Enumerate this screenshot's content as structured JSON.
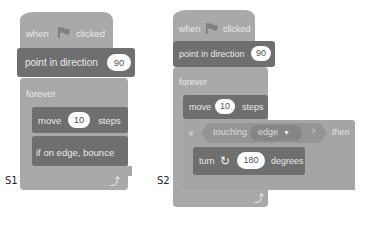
{
  "panels": [
    {
      "label": "S1",
      "blocks": {
        "hat": {
          "when": "when",
          "clicked": "clicked",
          "icon": "green-flag-icon"
        },
        "point": {
          "label": "point in direction",
          "value": "90"
        },
        "forever": {
          "label": "forever",
          "loop_icon": "loop-arrow-icon"
        },
        "move": {
          "label": "move",
          "value": "10",
          "suffix": "steps"
        },
        "bounce": {
          "label": "if on edge, bounce"
        }
      }
    },
    {
      "label": "S2",
      "blocks": {
        "hat": {
          "when": "when",
          "clicked": "clicked",
          "icon": "green-flag-icon"
        },
        "point": {
          "label": "point in direction",
          "value": "90"
        },
        "forever": {
          "label": "forever",
          "loop_icon": "loop-arrow-icon"
        },
        "move": {
          "label": "move",
          "value": "10",
          "suffix": "steps"
        },
        "if": {
          "label": "if",
          "condition": "touching",
          "target": "edge",
          "question": "?",
          "then": "then"
        },
        "turn": {
          "label": "turn",
          "icon": "rotate-clockwise-icon",
          "value": "180",
          "suffix": "degrees"
        }
      }
    }
  ]
}
